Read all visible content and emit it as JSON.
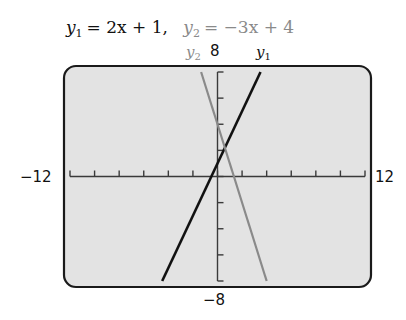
{
  "chart_data": {
    "type": "line",
    "title_parts": {
      "y1_expr": "= 2x + 1,",
      "y2_expr": "= −3x + 4"
    },
    "xlim": [
      -12,
      12
    ],
    "ylim": [
      -8,
      8
    ],
    "x_tick_step": 2,
    "y_tick_step": 2,
    "grid": false,
    "window_labels": {
      "xmin": "−12",
      "xmax": "12",
      "ymin": "−8",
      "ymax": "8"
    },
    "series": [
      {
        "name": "y1",
        "label": "y",
        "subscript": "1",
        "equation": "y1 = 2x + 1",
        "slope": 2,
        "intercept": 1,
        "color": "#111111",
        "x": [
          -4.5,
          3.5
        ],
        "y": [
          -8,
          8
        ]
      },
      {
        "name": "y2",
        "label": "y",
        "subscript": "2",
        "equation": "y2 = −3x + 4",
        "slope": -3,
        "intercept": 4,
        "color": "#8a8a8a",
        "x": [
          -1.333,
          4
        ],
        "y": [
          8,
          -8
        ]
      }
    ],
    "intersection": {
      "x": 0.6,
      "y": 2.2
    },
    "background_color": "#e3e3e3",
    "frame_color": "#1a1a1a"
  }
}
